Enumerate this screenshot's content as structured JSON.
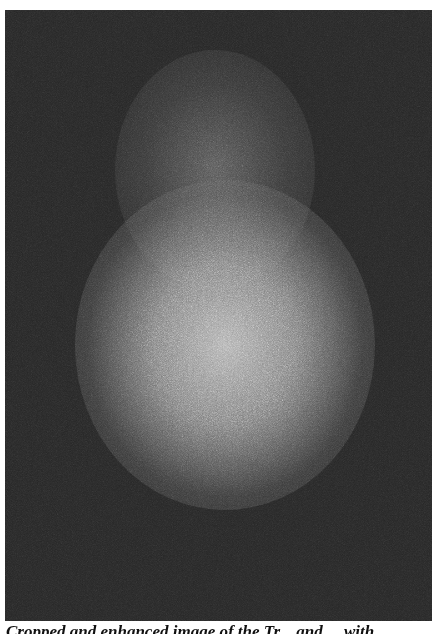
{
  "figure": {
    "image_description": "grainy grayscale photo with diffuse bright glow",
    "background_color": "#262626",
    "glow_color": "#b4b4b4"
  },
  "caption": {
    "text": "Cropped and enhanced image of the Tr... and ... with ..."
  }
}
